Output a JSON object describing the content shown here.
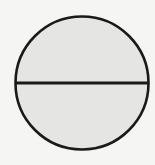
{
  "diagram": {
    "shape": "circle-with-horizontal-diameter",
    "circle": {
      "cx": 82,
      "cy": 83,
      "r": 66.5,
      "fill": "#e5e5e4",
      "stroke": "#1a1a1a",
      "stroke_width": 2.6
    },
    "diameter": {
      "x1": 15.5,
      "y1": 83,
      "x2": 148.5,
      "y2": 83,
      "stroke": "#1a1a1a",
      "stroke_width": 2.8
    },
    "background": "#f5f5f4"
  }
}
